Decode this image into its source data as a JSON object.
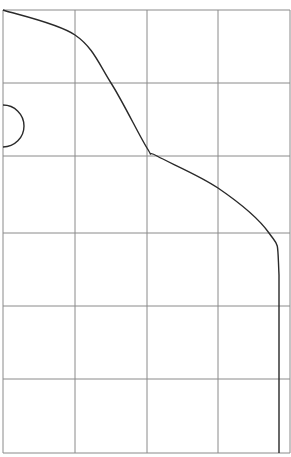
{
  "diagram": {
    "type": "grid-with-curve",
    "background": "#ffffff",
    "grid": {
      "color": "#8a8a8a",
      "stroke_width": 1,
      "columns_x": [
        3,
        75,
        147,
        218,
        290
      ],
      "rows_y": [
        10,
        83,
        156,
        233,
        306,
        379,
        453
      ]
    },
    "curve": {
      "color": "#2a2a2a",
      "stroke_width": 1.4,
      "description": "S-shaped boundary curve from top-left corner descending to right edge, then vertical line to bottom",
      "points": [
        [
          3,
          10
        ],
        [
          75,
          35
        ],
        [
          111,
          83
        ],
        [
          147,
          148
        ],
        [
          157,
          156
        ],
        [
          218,
          188
        ],
        [
          269,
          233
        ],
        [
          279,
          275
        ],
        [
          279,
          453
        ]
      ]
    },
    "semicircle": {
      "color": "#2a2a2a",
      "stroke_width": 1.4,
      "center": [
        3,
        126
      ],
      "radius": 21,
      "orientation": "right"
    }
  }
}
